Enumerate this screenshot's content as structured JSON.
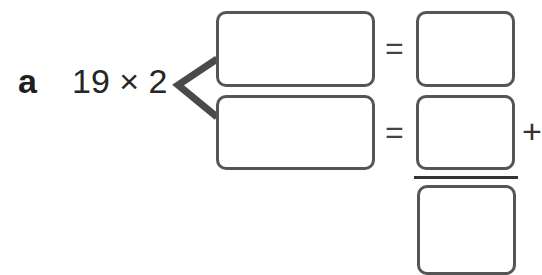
{
  "problem": {
    "label": "a",
    "expression": "19 × 2",
    "operator_equals": "=",
    "operator_plus": "+"
  },
  "boxes": {
    "split_top": "",
    "split_bottom": "",
    "result_top": "",
    "result_middle": "",
    "result_total": ""
  },
  "colors": {
    "box_border": "#555555",
    "bracket": "#4a4a4a",
    "text": "#262626"
  }
}
